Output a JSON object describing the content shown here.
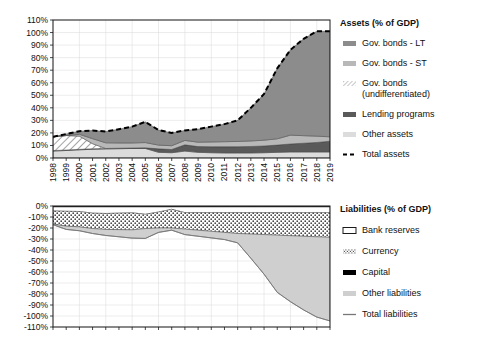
{
  "figure": {
    "width": 488,
    "height": 339,
    "background": "#ffffff"
  },
  "colors": {
    "gov_bonds_lt": "#8c8c8c",
    "gov_bonds_st": "#b8b8b8",
    "gov_bonds_undiff": "#ffffff",
    "lending_programs": "#5a5a5a",
    "other_assets": "#dcdcdc",
    "total_assets_line": "#000000",
    "bank_reserves": "#ffffff",
    "currency": "#ffffff",
    "capital": "#000000",
    "other_liabilities": "#cfcfcf",
    "total_liabilities_line": "#777777",
    "axis": "#1a1a1a",
    "grid": "#d8d8d8"
  },
  "assets_legend": {
    "title": "Assets (% of GDP)",
    "items": [
      {
        "label": "Gov. bonds - LT",
        "swatch": "bar",
        "color": "#8c8c8c"
      },
      {
        "label": "Gov. bonds - ST",
        "swatch": "bar",
        "color": "#b8b8b8"
      },
      {
        "label": "Gov. bonds",
        "label2": "(undifferentiated)",
        "swatch": "hatch",
        "color": "#ffffff"
      },
      {
        "label": "Lending programs",
        "swatch": "bar",
        "color": "#5a5a5a"
      },
      {
        "label": "Other assets",
        "swatch": "bar",
        "color": "#dcdcdc"
      },
      {
        "label": "Total assets",
        "swatch": "dashed",
        "color": "#000000"
      }
    ]
  },
  "liabilities_legend": {
    "title": "Liabilities (% of GDP)",
    "items": [
      {
        "label": "Bank reserves",
        "swatch": "outline",
        "color": "#ffffff"
      },
      {
        "label": "Currency",
        "swatch": "dots",
        "color": "#ffffff"
      },
      {
        "label": "Capital",
        "swatch": "bar",
        "color": "#000000"
      },
      {
        "label": "Other liabilities",
        "swatch": "bar",
        "color": "#cfcfcf"
      },
      {
        "label": "Total liabilities",
        "swatch": "line",
        "color": "#777777"
      }
    ]
  },
  "chart_data": [
    {
      "type": "area",
      "id": "assets",
      "title": "Assets (% of GDP)",
      "xlabel": "",
      "ylabel": "",
      "grid": true,
      "legend_position": "right",
      "ylim": [
        0,
        110
      ],
      "yticks": [
        0,
        10,
        20,
        30,
        40,
        50,
        60,
        70,
        80,
        90,
        100,
        110
      ],
      "ytick_labels": [
        "0%",
        "10%",
        "20%",
        "30%",
        "40%",
        "50%",
        "60%",
        "70%",
        "80%",
        "90%",
        "100%",
        "110%"
      ],
      "x": [
        1998,
        1999,
        2000,
        2001,
        2002,
        2003,
        2004,
        2005,
        2006,
        2007,
        2008,
        2009,
        2010,
        2011,
        2012,
        2013,
        2014,
        2015,
        2016,
        2017,
        2018,
        2019
      ],
      "xtick_labels": [
        "1998",
        "1999",
        "2000",
        "2001",
        "2002",
        "2003",
        "2004",
        "2005",
        "2006",
        "2007",
        "2008",
        "2009",
        "2010",
        "2011",
        "2012",
        "2013",
        "2014",
        "2015",
        "2016",
        "2017",
        "2018",
        "2019"
      ],
      "stack_order": [
        "other_assets",
        "lending_programs",
        "gov_bonds_undiff",
        "gov_bonds_st",
        "gov_bonds_lt"
      ],
      "series": [
        {
          "name": "Other assets",
          "key": "other_assets",
          "values": [
            5.5,
            6.0,
            6.5,
            7.0,
            7.2,
            7.4,
            7.6,
            7.6,
            4.5,
            4.2,
            5.5,
            4.5,
            4.2,
            4.0,
            4.0,
            4.0,
            4.2,
            4.5,
            4.8,
            4.8,
            4.8,
            4.8
          ]
        },
        {
          "name": "Lending programs",
          "key": "lending_programs",
          "values": [
            0.4,
            0.4,
            0.4,
            0.4,
            0.4,
            0.4,
            0.4,
            0.5,
            2.8,
            2.6,
            5.0,
            4.6,
            4.8,
            5.0,
            5.0,
            5.2,
            5.4,
            5.8,
            6.4,
            7.0,
            7.6,
            8.6
          ]
        },
        {
          "name": "Gov. bonds (undifferentiated)",
          "key": "gov_bonds_undiff",
          "values": [
            11.0,
            11.5,
            10.5,
            4.0,
            0,
            0,
            0,
            0,
            0,
            0,
            0,
            0,
            0,
            0,
            0,
            0,
            0,
            0,
            0,
            0,
            0,
            0
          ]
        },
        {
          "name": "Gov. bonds - ST",
          "key": "gov_bonds_st",
          "values": [
            0,
            0,
            1.5,
            4.0,
            4.5,
            4.2,
            4.0,
            4.2,
            3.0,
            3.0,
            3.5,
            3.5,
            3.8,
            4.0,
            4.2,
            4.4,
            4.6,
            5.0,
            7.0,
            6.0,
            5.0,
            3.5
          ]
        },
        {
          "name": "Gov. bonds - LT",
          "key": "gov_bonds_lt",
          "values": [
            0,
            1.2,
            2.5,
            6.5,
            9.0,
            11.0,
            13.0,
            16.5,
            12.0,
            10.2,
            8.0,
            10.4,
            12.2,
            14.0,
            16.8,
            26.4,
            36.8,
            56.2,
            68.0,
            77.2,
            83.6,
            84.1
          ]
        }
      ],
      "total_line": {
        "name": "Total assets",
        "values": [
          16.9,
          19.1,
          21.4,
          21.9,
          21.1,
          23.0,
          25.0,
          28.8,
          22.3,
          20.0,
          22.0,
          23.0,
          25.0,
          27.0,
          30.0,
          40.0,
          51.0,
          71.5,
          86.2,
          95.0,
          101.0,
          101.0
        ],
        "style": "dashed"
      }
    },
    {
      "type": "area",
      "id": "liabilities",
      "title": "Liabilities (% of GDP)",
      "xlabel": "",
      "ylabel": "",
      "grid": true,
      "legend_position": "right",
      "ylim": [
        -110,
        0
      ],
      "yticks": [
        0,
        -10,
        -20,
        -30,
        -40,
        -50,
        -60,
        -70,
        -80,
        -90,
        -100,
        -110
      ],
      "ytick_labels": [
        "0%",
        "-10%",
        "-20%",
        "-30%",
        "-40%",
        "-50%",
        "-60%",
        "-70%",
        "-80%",
        "-90%",
        "-100%",
        "-110%"
      ],
      "x": [
        1998,
        1999,
        2000,
        2001,
        2002,
        2003,
        2004,
        2005,
        2006,
        2007,
        2008,
        2009,
        2010,
        2011,
        2012,
        2013,
        2014,
        2015,
        2016,
        2017,
        2018,
        2019
      ],
      "xtick_labels": [
        "1998",
        "1999",
        "2000",
        "2001",
        "2002",
        "2003",
        "2004",
        "2005",
        "2006",
        "2007",
        "2008",
        "2009",
        "2010",
        "2011",
        "2012",
        "2013",
        "2014",
        "2015",
        "2016",
        "2017",
        "2018",
        "2019"
      ],
      "stack_order": [
        "capital",
        "bank_reserves",
        "currency",
        "other_liabilities"
      ],
      "series": [
        {
          "name": "Capital",
          "key": "capital",
          "values": [
            -1.0,
            -1.0,
            -1.0,
            -1.0,
            -1.0,
            -1.0,
            -1.0,
            -1.0,
            -1.0,
            -1.0,
            -1.0,
            -1.0,
            -1.0,
            -1.0,
            -1.0,
            -1.0,
            -1.0,
            -1.0,
            -1.0,
            -1.0,
            -1.0,
            -1.0
          ]
        },
        {
          "name": "Bank reserves",
          "key": "bank_reserves",
          "values": [
            -3.5,
            -3.8,
            -4.0,
            -5.5,
            -5.8,
            -5.5,
            -5.2,
            -6.5,
            -4.5,
            -2.0,
            -5.0,
            -5.0,
            -5.0,
            -5.0,
            -5.0,
            -5.0,
            -5.0,
            -5.0,
            -5.0,
            -5.0,
            -5.0,
            -5.0
          ]
        },
        {
          "name": "Currency",
          "key": "currency",
          "values": [
            -12.0,
            -13.5,
            -14.0,
            -14.0,
            -14.5,
            -15.0,
            -15.5,
            -13.0,
            -14.5,
            -17.0,
            -15.0,
            -16.0,
            -17.0,
            -18.0,
            -19.0,
            -19.5,
            -20.0,
            -20.5,
            -21.0,
            -21.5,
            -22.0,
            -22.5
          ]
        },
        {
          "name": "Other liabilities",
          "key": "other_liabilities",
          "values": [
            -0.5,
            -3.0,
            -3.5,
            -4.5,
            -5.5,
            -6.5,
            -7.5,
            -9.0,
            -4.0,
            -2.0,
            -5.0,
            -5.5,
            -6.0,
            -6.5,
            -8.5,
            -22.0,
            -36.0,
            -52.0,
            -60.0,
            -67.0,
            -73.0,
            -76.0
          ]
        }
      ],
      "total_line": {
        "name": "Total liabilities",
        "values": [
          -17.0,
          -21.3,
          -22.5,
          -25.0,
          -26.8,
          -28.0,
          -29.2,
          -29.5,
          -24.0,
          -22.0,
          -26.0,
          -27.5,
          -29.0,
          -30.5,
          -33.5,
          -47.5,
          -62.0,
          -78.5,
          -87.0,
          -94.5,
          -101.0,
          -104.5
        ],
        "style": "solid"
      }
    }
  ]
}
